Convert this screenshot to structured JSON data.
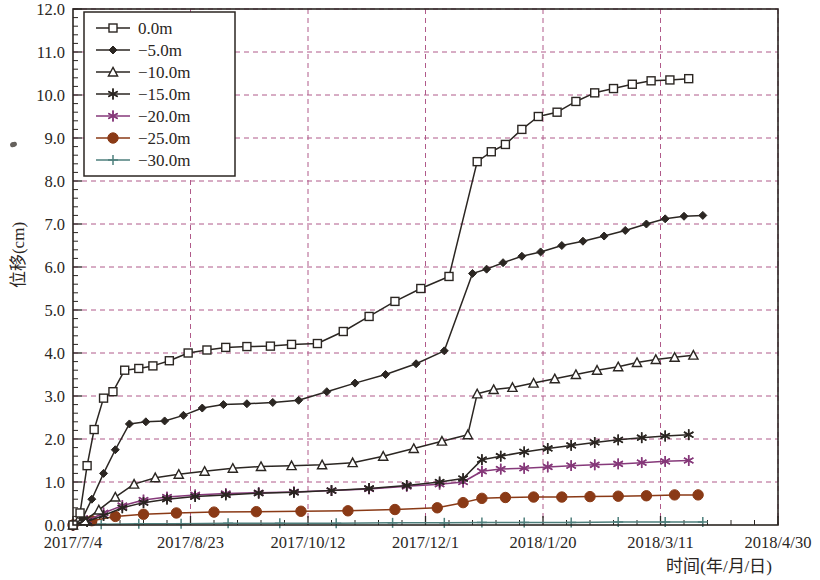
{
  "chart_data": {
    "type": "line",
    "title": "",
    "xlabel": "时间(年/月/日)",
    "ylabel": "位移(cm)",
    "ylim": [
      0.0,
      12.0
    ],
    "ytick_labels": [
      "0.0",
      "1.0",
      "2.0",
      "3.0",
      "4.0",
      "5.0",
      "6.0",
      "7.0",
      "8.0",
      "9.0",
      "10.0",
      "11.0",
      "12.0"
    ],
    "ytick_values": [
      0,
      1,
      2,
      3,
      4,
      5,
      6,
      7,
      8,
      9,
      10,
      11,
      12
    ],
    "y_minor_per_major": 5,
    "xtick_labels": [
      "2017/7/4",
      "2017/8/23",
      "2017/10/12",
      "2017/12/1",
      "2018/1/20",
      "2018/3/11",
      "2018/4/30"
    ],
    "xtick_days": [
      0,
      50,
      100,
      150,
      200,
      250,
      300
    ],
    "xlim_days": [
      0,
      300
    ],
    "x_minor_per_major": 5,
    "grid": "dashed-magenta",
    "legend_position": "top-left",
    "series": [
      {
        "name": "0.0m",
        "legend_label": "0.0m",
        "color": "#2b2622",
        "marker": "square-open",
        "points": [
          [
            0,
            0.0
          ],
          [
            3,
            0.28
          ],
          [
            6,
            1.38
          ],
          [
            9,
            2.22
          ],
          [
            13,
            2.95
          ],
          [
            17,
            3.1
          ],
          [
            22,
            3.6
          ],
          [
            28,
            3.64
          ],
          [
            34,
            3.7
          ],
          [
            41,
            3.82
          ],
          [
            49,
            4.0
          ],
          [
            57,
            4.07
          ],
          [
            65,
            4.13
          ],
          [
            74,
            4.15
          ],
          [
            84,
            4.16
          ],
          [
            93,
            4.2
          ],
          [
            104,
            4.22
          ],
          [
            115,
            4.5
          ],
          [
            126,
            4.85
          ],
          [
            137,
            5.2
          ],
          [
            148,
            5.5
          ],
          [
            160,
            5.78
          ],
          [
            172,
            8.45
          ],
          [
            178,
            8.68
          ],
          [
            184,
            8.85
          ],
          [
            191,
            9.2
          ],
          [
            198,
            9.5
          ],
          [
            206,
            9.6
          ],
          [
            214,
            9.85
          ],
          [
            222,
            10.05
          ],
          [
            230,
            10.15
          ],
          [
            238,
            10.25
          ],
          [
            246,
            10.33
          ],
          [
            254,
            10.35
          ],
          [
            262,
            10.38
          ]
        ]
      },
      {
        "name": "-5.0m",
        "legend_label": "−5.0m",
        "color": "#2b2622",
        "marker": "diamond-filled",
        "points": [
          [
            0,
            0.0
          ],
          [
            4,
            0.15
          ],
          [
            8,
            0.6
          ],
          [
            13,
            1.2
          ],
          [
            18,
            1.75
          ],
          [
            24,
            2.35
          ],
          [
            31,
            2.4
          ],
          [
            39,
            2.42
          ],
          [
            47,
            2.55
          ],
          [
            55,
            2.72
          ],
          [
            64,
            2.8
          ],
          [
            74,
            2.82
          ],
          [
            85,
            2.85
          ],
          [
            96,
            2.9
          ],
          [
            108,
            3.1
          ],
          [
            120,
            3.3
          ],
          [
            133,
            3.5
          ],
          [
            146,
            3.75
          ],
          [
            158,
            4.05
          ],
          [
            170,
            5.85
          ],
          [
            176,
            5.95
          ],
          [
            183,
            6.1
          ],
          [
            191,
            6.25
          ],
          [
            199,
            6.35
          ],
          [
            208,
            6.5
          ],
          [
            217,
            6.6
          ],
          [
            226,
            6.72
          ],
          [
            235,
            6.85
          ],
          [
            244,
            7.0
          ],
          [
            252,
            7.12
          ],
          [
            260,
            7.18
          ],
          [
            268,
            7.2
          ]
        ]
      },
      {
        "name": "-10.0m",
        "legend_label": "−10.0m",
        "color": "#2b2622",
        "marker": "triangle-open",
        "points": [
          [
            0,
            0.0
          ],
          [
            5,
            0.1
          ],
          [
            11,
            0.35
          ],
          [
            18,
            0.65
          ],
          [
            26,
            0.95
          ],
          [
            35,
            1.1
          ],
          [
            45,
            1.18
          ],
          [
            56,
            1.25
          ],
          [
            68,
            1.32
          ],
          [
            80,
            1.36
          ],
          [
            93,
            1.38
          ],
          [
            106,
            1.4
          ],
          [
            119,
            1.45
          ],
          [
            132,
            1.6
          ],
          [
            145,
            1.78
          ],
          [
            157,
            1.95
          ],
          [
            168,
            2.1
          ],
          [
            172,
            3.05
          ],
          [
            179,
            3.15
          ],
          [
            187,
            3.2
          ],
          [
            196,
            3.3
          ],
          [
            205,
            3.4
          ],
          [
            214,
            3.5
          ],
          [
            223,
            3.6
          ],
          [
            232,
            3.68
          ],
          [
            240,
            3.78
          ],
          [
            248,
            3.85
          ],
          [
            256,
            3.9
          ],
          [
            264,
            3.95
          ]
        ]
      },
      {
        "name": "-15.0m",
        "legend_label": "−15.0m",
        "color": "#2b2622",
        "marker": "asterisk",
        "points": [
          [
            0,
            0.0
          ],
          [
            6,
            0.08
          ],
          [
            13,
            0.22
          ],
          [
            21,
            0.4
          ],
          [
            30,
            0.52
          ],
          [
            40,
            0.6
          ],
          [
            52,
            0.66
          ],
          [
            65,
            0.7
          ],
          [
            79,
            0.74
          ],
          [
            94,
            0.76
          ],
          [
            110,
            0.8
          ],
          [
            126,
            0.85
          ],
          [
            142,
            0.92
          ],
          [
            156,
            1.0
          ],
          [
            166,
            1.08
          ],
          [
            174,
            1.52
          ],
          [
            182,
            1.6
          ],
          [
            192,
            1.7
          ],
          [
            202,
            1.78
          ],
          [
            212,
            1.85
          ],
          [
            222,
            1.92
          ],
          [
            232,
            1.98
          ],
          [
            242,
            2.03
          ],
          [
            252,
            2.07
          ],
          [
            262,
            2.1
          ]
        ]
      },
      {
        "name": "-20.0m",
        "legend_label": "−20.0m",
        "color": "#86397a",
        "marker": "asterisk",
        "points": [
          [
            0,
            0.0
          ],
          [
            6,
            0.1
          ],
          [
            13,
            0.28
          ],
          [
            21,
            0.45
          ],
          [
            30,
            0.58
          ],
          [
            40,
            0.65
          ],
          [
            52,
            0.7
          ],
          [
            65,
            0.73
          ],
          [
            79,
            0.75
          ],
          [
            94,
            0.77
          ],
          [
            110,
            0.8
          ],
          [
            126,
            0.84
          ],
          [
            142,
            0.9
          ],
          [
            156,
            0.95
          ],
          [
            166,
            1.0
          ],
          [
            174,
            1.25
          ],
          [
            182,
            1.3
          ],
          [
            192,
            1.32
          ],
          [
            202,
            1.35
          ],
          [
            212,
            1.38
          ],
          [
            222,
            1.4
          ],
          [
            232,
            1.42
          ],
          [
            242,
            1.45
          ],
          [
            252,
            1.48
          ],
          [
            262,
            1.5
          ]
        ]
      },
      {
        "name": "-25.0m",
        "legend_label": "−25.0m",
        "color": "#8a3a16",
        "marker": "circle-filled",
        "points": [
          [
            0,
            0.0
          ],
          [
            8,
            0.1
          ],
          [
            18,
            0.2
          ],
          [
            30,
            0.25
          ],
          [
            44,
            0.28
          ],
          [
            60,
            0.3
          ],
          [
            78,
            0.31
          ],
          [
            97,
            0.32
          ],
          [
            117,
            0.33
          ],
          [
            137,
            0.36
          ],
          [
            155,
            0.4
          ],
          [
            166,
            0.52
          ],
          [
            174,
            0.62
          ],
          [
            184,
            0.64
          ],
          [
            196,
            0.65
          ],
          [
            208,
            0.65
          ],
          [
            220,
            0.66
          ],
          [
            232,
            0.67
          ],
          [
            244,
            0.68
          ],
          [
            256,
            0.7
          ],
          [
            266,
            0.7
          ]
        ]
      },
      {
        "name": "-30.0m",
        "legend_label": "−30.0m",
        "color": "#4e7f7c",
        "marker": "plus",
        "points": [
          [
            0,
            0.0
          ],
          [
            12,
            0.02
          ],
          [
            28,
            0.03
          ],
          [
            46,
            0.03
          ],
          [
            66,
            0.04
          ],
          [
            88,
            0.04
          ],
          [
            112,
            0.04
          ],
          [
            136,
            0.05
          ],
          [
            158,
            0.05
          ],
          [
            174,
            0.06
          ],
          [
            192,
            0.06
          ],
          [
            212,
            0.06
          ],
          [
            232,
            0.07
          ],
          [
            252,
            0.07
          ],
          [
            268,
            0.07
          ]
        ]
      }
    ]
  }
}
